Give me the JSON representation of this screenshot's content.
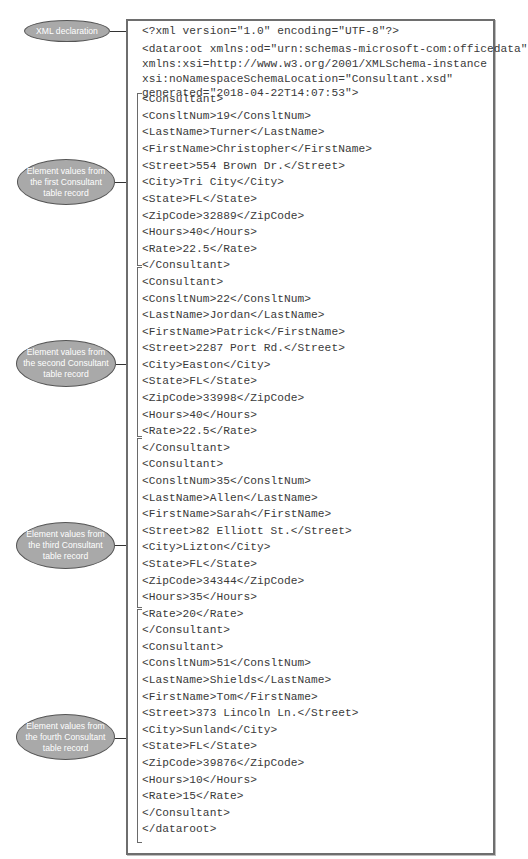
{
  "figure": {
    "colors": {
      "callout_fill": "#a9a9a9",
      "callout_border": "#555555",
      "callout_text": "#ffffff",
      "box_border": "#6e6e6e",
      "code_text": "#3a3a3a"
    },
    "callouts": [
      {
        "id": "xml-declaration",
        "label": "XML declaration"
      },
      {
        "id": "first-record",
        "label": "Element values from\nthe first Consultant\ntable record"
      },
      {
        "id": "second-record",
        "label": "Element values from\nthe second Consultant\ntable record"
      },
      {
        "id": "third-record",
        "label": "Element values from\nthe third Consultant\ntable record"
      },
      {
        "id": "fourth-record",
        "label": "Element values from\nthe fourth Consultant\ntable record"
      }
    ],
    "xml": {
      "declaration": "<?xml version=\"1.0\" encoding=\"UTF-8\"?>",
      "dataroot_open": [
        "<dataroot xmlns:od=\"urn:schemas-microsoft-com:officedata\"",
        "xmlns:xsi=http://www.w3.org/2001/XMLSchema-instance",
        "xsi:noNamespaceSchemaLocation=\"Consultant.xsd\"",
        "generated=\"2018-04-22T14:07:53\">"
      ],
      "records": [
        {
          "lines": [
            "<Consultant>",
            "<ConsltNum>19</ConsltNum>",
            "<LastName>Turner</LastName>",
            "<FirstName>Christopher</FirstName>",
            "<Street>554 Brown Dr.</Street>",
            "<City>Tri City</City>",
            "<State>FL</State>",
            "<ZipCode>32889</ZipCode>",
            "<Hours>40</Hours>",
            "<Rate>22.5</Rate>",
            "</Consultant>"
          ]
        },
        {
          "lines": [
            "<Consultant>",
            "<ConsltNum>22</ConsltNum>",
            "<LastName>Jordan</LastName>",
            "<FirstName>Patrick</FirstName>",
            "<Street>2287 Port Rd.</Street>",
            "<City>Easton</City>",
            "<State>FL</State>",
            "<ZipCode>33998</ZipCode>",
            "<Hours>40</Hours>",
            "<Rate>22.5</Rate>",
            "</Consultant>"
          ]
        },
        {
          "lines": [
            "<Consultant>",
            "<ConsltNum>35</ConsltNum>",
            "<LastName>Allen</LastName>",
            "<FirstName>Sarah</FirstName>",
            "<Street>82 Elliott St.</Street>",
            "<City>Lizton</City>",
            "<State>FL</State>",
            "<ZipCode>34344</ZipCode>",
            "<Hours>35</Hours>",
            "<Rate>20</Rate>",
            "</Consultant>"
          ]
        },
        {
          "lines": [
            "<Consultant>",
            "<ConsltNum>51</ConsltNum>",
            "<LastName>Shields</LastName>",
            "<FirstName>Tom</FirstName>",
            "<Street>373 Lincoln Ln.</Street>",
            "<City>Sunland</City>",
            "<State>FL</State>",
            "<ZipCode>39876</ZipCode>",
            "<Hours>10</Hours>",
            "<Rate>15</Rate>",
            "</Consultant>"
          ]
        }
      ],
      "dataroot_close": "</dataroot>"
    }
  }
}
